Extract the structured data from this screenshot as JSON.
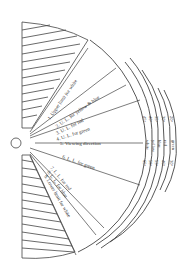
{
  "labels": {
    "l1": "1. Upper limit for white",
    "l2": "2. U. L. for yellow & blue",
    "l3": "3. U. L. for red",
    "l4": "4. U. L. for green",
    "l5": "5. Viewing direction",
    "l6": "6. L. L. for green",
    "l7": "7. L. L. for red",
    "l8": "8. L. L. for blue",
    "l8b": "yellow",
    "l9": "9. Lower limit for white"
  },
  "colors_right": [
    "white",
    "yellow",
    "blue",
    "red",
    "green"
  ],
  "upper_angles": [
    "45°",
    "40°",
    "35°",
    "30°",
    "20°"
  ],
  "lower_angles": [
    "65°",
    "58°",
    "53°",
    "46°",
    "30°"
  ],
  "eye_label": "eye"
}
